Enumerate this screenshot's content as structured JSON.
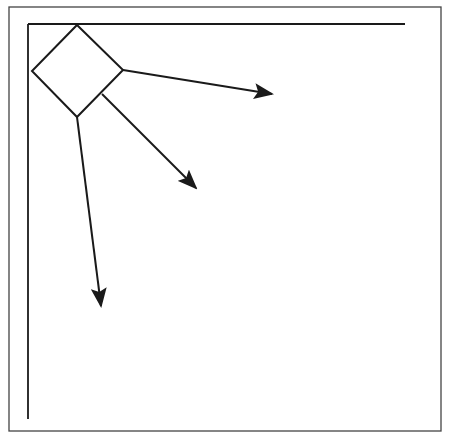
{
  "diagram": {
    "type": "vector-diagram",
    "colors": {
      "background": "#ffffff",
      "frame": "#444444",
      "stroke": "#1a1a1a",
      "arrowhead": "#1a1a1a"
    },
    "frame": {
      "x": 9,
      "y": 7,
      "width": 432,
      "height": 424
    },
    "axes": {
      "horizontal": {
        "x1": 28,
        "y1": 24,
        "x2": 405,
        "y2": 24
      },
      "vertical": {
        "x1": 28,
        "y1": 24,
        "x2": 28,
        "y2": 419
      }
    },
    "diamond": {
      "points": "77,25 123,70 77,117 32,71"
    },
    "arrows": [
      {
        "name": "arrow-right",
        "x1": 123,
        "y1": 70,
        "x2": 272,
        "y2": 94
      },
      {
        "name": "arrow-diagonal",
        "x1": 102,
        "y1": 94,
        "x2": 196,
        "y2": 188
      },
      {
        "name": "arrow-down",
        "x1": 77,
        "y1": 117,
        "x2": 101,
        "y2": 306
      }
    ]
  }
}
